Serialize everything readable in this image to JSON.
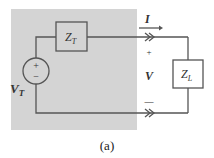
{
  "diagram": {
    "type": "circuit",
    "caption": "(a)",
    "shaded_region": {
      "color": "#d4d4d4",
      "meaning": "Thevenin equivalent network"
    },
    "components": {
      "source": {
        "label_main": "V",
        "label_sub": "T",
        "plus": "+",
        "minus": "−"
      },
      "thevenin_impedance": {
        "label_main": "Z",
        "label_sub": "T"
      },
      "load_impedance": {
        "label_main": "Z",
        "label_sub": "L"
      }
    },
    "current": {
      "label": "I",
      "direction": "right"
    },
    "voltage": {
      "label": "V",
      "plus": "+",
      "minus": "—"
    },
    "colors": {
      "wire": "#555555",
      "shade": "#d4d4d4",
      "background": "#ffffff"
    }
  }
}
